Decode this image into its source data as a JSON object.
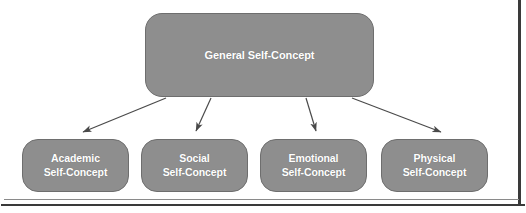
{
  "diagram": {
    "type": "hierarchy-tree",
    "colors": {
      "node_fill": "#8e8e8e",
      "node_border": "#6e6e6e",
      "node_text": "#ffffff",
      "arrow": "#4a4a4a",
      "background": "#ffffff",
      "frame_line": "#3a3a3a"
    },
    "root": {
      "label": "General Self-Concept"
    },
    "children": [
      {
        "line1": "Academic",
        "line2": "Self-Concept"
      },
      {
        "line1": "Social",
        "line2": "Self-Concept"
      },
      {
        "line1": "Emotional",
        "line2": "Self-Concept"
      },
      {
        "line1": "Physical",
        "line2": "Self-Concept"
      }
    ],
    "edges": [
      {
        "from": "General Self-Concept",
        "to": "Academic Self-Concept",
        "style": "arrow"
      },
      {
        "from": "General Self-Concept",
        "to": "Social Self-Concept",
        "style": "arrow"
      },
      {
        "from": "General Self-Concept",
        "to": "Emotional Self-Concept",
        "style": "arrow"
      },
      {
        "from": "General Self-Concept",
        "to": "Physical Self-Concept",
        "style": "arrow"
      }
    ]
  }
}
